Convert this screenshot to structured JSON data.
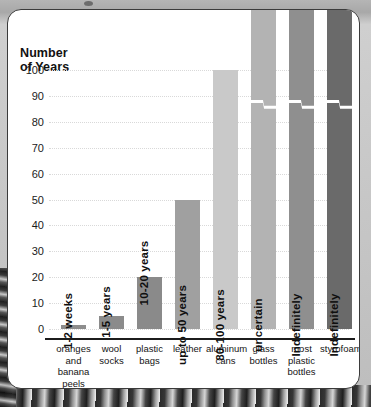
{
  "figure": {
    "axis_title_line1": "Number",
    "axis_title_line2": "of Years",
    "panel_border_color": "#3b3b3b",
    "panel_background": "#ffffff"
  },
  "chart_data": {
    "type": "bar",
    "title": "Number of Years",
    "xlabel": "",
    "ylabel": "Number of Years",
    "ylim": [
      0,
      100
    ],
    "yticks": [
      0,
      10,
      20,
      30,
      40,
      50,
      60,
      70,
      80,
      90,
      100
    ],
    "grid": true,
    "legend": "none",
    "axis_break_note": "The last three bars are drawn with a zig-zag axis break and run off the top of the plot (no finite value).",
    "categories": [
      "oranges and banana peels",
      "wool socks",
      "plastic bags",
      "leather",
      "aluminum cans",
      "glass bottles",
      "most plastic bottles",
      "styrofoam"
    ],
    "category_label_lines": [
      [
        "oranges",
        "and",
        "banana",
        "peels"
      ],
      [
        "wool",
        "socks"
      ],
      [
        "plastic",
        "bags"
      ],
      [
        "leather"
      ],
      [
        "aluminum",
        "cans"
      ],
      [
        "glass",
        "bottles"
      ],
      [
        "most",
        "plastic",
        "bottles"
      ],
      [
        "styrofoam"
      ]
    ],
    "values": [
      1.5,
      5,
      20,
      50,
      100,
      105,
      105,
      105
    ],
    "data_labels": [
      "1-2 weeks",
      "1-5 years",
      "10-20 years",
      "up to 50 years",
      "80-100 years",
      "uncertain",
      "Indefinitely",
      "Indefinitely"
    ],
    "bar_colors": [
      "#8d8d8d",
      "#8b8b8b",
      "#8a8a8a",
      "#a0a0a0",
      "#c9c9c9",
      "#b3b3b3",
      "#8f8f8f",
      "#6a6a6a"
    ],
    "bars_with_break": [
      false,
      false,
      false,
      false,
      false,
      true,
      true,
      true
    ]
  }
}
